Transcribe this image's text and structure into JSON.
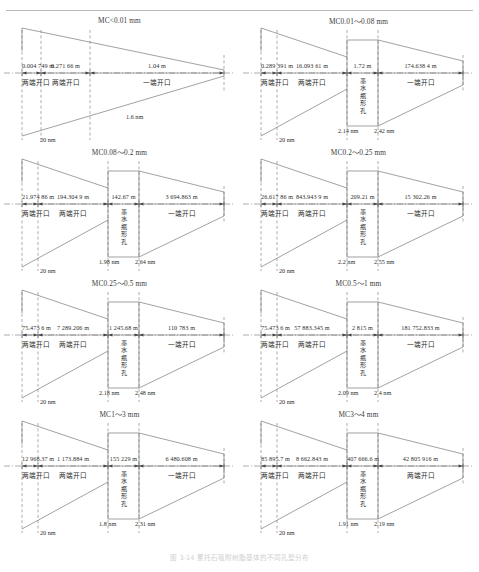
{
  "figure": {
    "caption": "图 3-14   累托石吸附树脂基体的不同孔型分布",
    "axis_unit": "m",
    "pore_label": "墨水瓶形孔",
    "open_both_label": "两端开口",
    "open_one_label": "一端开口",
    "scale_left": "20 nm"
  },
  "panels": [
    {
      "id": "mc-lt-0.01",
      "title": "MC<0.01 mm",
      "has_bottle": false,
      "segments": [
        {
          "value": "0.004 749 m",
          "label": "两端开口"
        },
        {
          "value": "0.271 66 m",
          "label": "两端开口"
        },
        {
          "value": "1.04 m",
          "label": "一端开口"
        }
      ],
      "nm_labels": [
        "1.6 nm"
      ],
      "scale": "20 nm"
    },
    {
      "id": "mc-0.01-0.08",
      "title": "MC0.01～0.08 mm",
      "has_bottle": true,
      "segments": [
        {
          "value": "0.289 391 m",
          "label": "两端开口"
        },
        {
          "value": "16.093 61 m",
          "label": "两端开口"
        },
        {
          "value": "1.72 m",
          "label": "墨水瓶形孔"
        },
        {
          "value": "174.638 4 m",
          "label": "一端开口"
        }
      ],
      "nm_labels": [
        "2.14 nm",
        "2.42 nm"
      ],
      "scale": "20 nm"
    },
    {
      "id": "mc-0.08-0.2",
      "title": "MC0.08～0.2 mm",
      "has_bottle": true,
      "segments": [
        {
          "value": "21.974 86 m",
          "label": "两端开口"
        },
        {
          "value": "194.304 9 m",
          "label": "两端开口"
        },
        {
          "value": "142.67 m",
          "label": "墨水瓶形孔"
        },
        {
          "value": "3 694.863 m",
          "label": "一端开口"
        }
      ],
      "nm_labels": [
        "1.98 nm",
        "2.64 nm"
      ],
      "scale": "20 nm"
    },
    {
      "id": "mc-0.2-0.25",
      "title": "MC0.2～0.25 mm",
      "has_bottle": true,
      "segments": [
        {
          "value": "26.617 86 m",
          "label": "两端开口"
        },
        {
          "value": "843.943 9 m",
          "label": "两端开口"
        },
        {
          "value": "209.21 m",
          "label": "墨水瓶形孔"
        },
        {
          "value": "15 302.26 m",
          "label": "一端开口"
        }
      ],
      "nm_labels": [
        "2.2 nm",
        "2.55 nm"
      ],
      "scale": "20 nm"
    },
    {
      "id": "mc-0.25-0.5",
      "title": "MC0.25～0.5 mm",
      "has_bottle": true,
      "segments": [
        {
          "value": "75.473 6 m",
          "label": "两端开口"
        },
        {
          "value": "7 289.206 m",
          "label": "两端开口"
        },
        {
          "value": "1 245.68 m",
          "label": "墨水瓶形孔"
        },
        {
          "value": "110 783 m",
          "label": "一端开口"
        }
      ],
      "nm_labels": [
        "2.18 nm",
        "2.48 nm"
      ],
      "scale": "20 nm"
    },
    {
      "id": "mc-0.5-1",
      "title": "MC0.5～1 mm",
      "has_bottle": true,
      "segments": [
        {
          "value": "75.473 6 m",
          "label": "两端开口"
        },
        {
          "value": "57 883.345 m",
          "label": "两端开口"
        },
        {
          "value": "2 815 m",
          "label": "墨水瓶形孔"
        },
        {
          "value": "181 752.833 m",
          "label": "一端开口"
        }
      ],
      "nm_labels": [
        "2.09 nm",
        "2.4 nm"
      ],
      "scale": "20 nm"
    },
    {
      "id": "mc-1-3",
      "title": "MC1～3 mm",
      "has_bottle": true,
      "segments": [
        {
          "value": "12 968.37 m",
          "label": "两端开口"
        },
        {
          "value": "1 173.884 m",
          "label": "两端开口"
        },
        {
          "value": "155 229 m",
          "label": "墨水瓶形孔"
        },
        {
          "value": "6 480.608 m",
          "label": "一端开口"
        }
      ],
      "nm_labels": [
        "1.8 nm",
        "2.31 nm"
      ],
      "scale": "20 nm"
    },
    {
      "id": "mc-3-4",
      "title": "MC3～4 mm",
      "has_bottle": true,
      "segments": [
        {
          "value": "85 895.7 m",
          "label": "两端开口"
        },
        {
          "value": "8 662.843 m",
          "label": "两端开口"
        },
        {
          "value": "407 666.6 m",
          "label": "墨水瓶形孔"
        },
        {
          "value": "42 805 916 m",
          "label": "两端开口"
        }
      ],
      "nm_labels": [
        "1.91 nm",
        "2.19 nm"
      ],
      "scale": "20 nm"
    }
  ]
}
